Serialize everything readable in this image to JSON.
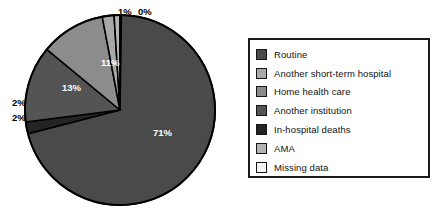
{
  "chart_data": {
    "type": "pie",
    "title": "",
    "legend_position": "right",
    "categories": [
      "Routine",
      "Another short-term hospital",
      "Home health care",
      "Another institution",
      "In-hospital deaths",
      "AMA",
      "Missing data"
    ],
    "values": [
      71,
      2,
      13,
      2,
      11,
      1,
      0
    ],
    "value_labels": [
      "71%",
      "2%",
      "13%",
      "2%",
      "11%",
      "1%",
      "0%"
    ],
    "colors": [
      "#4a4a4a",
      "#a8a8a8",
      "#8c8c8c",
      "#545454",
      "#242424",
      "#b4b4b4",
      "#f4f4f4"
    ],
    "slice_border_color": "#000000",
    "start_angle_deg": 0,
    "direction": "clockwise",
    "labels_on_slices": true
  },
  "pie": {
    "slices": [
      {
        "name": "Routine",
        "percent_label": "71%",
        "value": 71,
        "color": "#4a4a4a",
        "label_placement": "inside",
        "label_left": "153px",
        "label_top": "128px"
      },
      {
        "name": "Another short-term hospital",
        "percent_label": "2%",
        "value": 2,
        "color": "#a8a8a8",
        "label_placement": "outside",
        "label_left": "12px",
        "label_top": "98px"
      },
      {
        "name": "Home health care",
        "percent_label": "11%",
        "value": 11,
        "color": "#8c8c8c",
        "label_placement": "inside",
        "label_left": "101px",
        "label_top": "58px"
      },
      {
        "name": "Another institution",
        "percent_label": "13%",
        "value": 13,
        "color": "#545454",
        "label_placement": "inside",
        "label_left": "62px",
        "label_top": "83px"
      },
      {
        "name": "In-hospital deaths",
        "percent_label": "2%",
        "value": 2,
        "color": "#242424",
        "label_placement": "outside",
        "label_left": "12px",
        "label_top": "113px"
      },
      {
        "name": "AMA",
        "percent_label": "1%",
        "value": 1,
        "color": "#b4b4b4",
        "label_placement": "outside",
        "label_left": "118px",
        "label_top": "7px"
      },
      {
        "name": "Missing data",
        "percent_label": "0%",
        "value": 0,
        "color": "#f4f4f4",
        "label_placement": "outside",
        "label_left": "138px",
        "label_top": "7px"
      }
    ]
  },
  "legend": {
    "items": [
      {
        "label": "Routine",
        "color": "#4a4a4a"
      },
      {
        "label": "Another short-term hospital",
        "color": "#a8a8a8"
      },
      {
        "label": "Home health care",
        "color": "#8c8c8c"
      },
      {
        "label": "Another institution",
        "color": "#545454"
      },
      {
        "label": "In-hospital deaths",
        "color": "#242424"
      },
      {
        "label": "AMA",
        "color": "#b4b4b4"
      },
      {
        "label": "Missing data",
        "color": "#f4f4f4"
      }
    ]
  }
}
